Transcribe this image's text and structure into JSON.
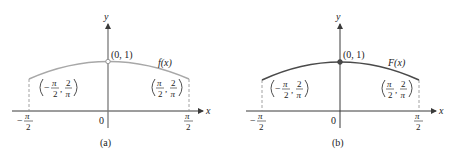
{
  "colors": {
    "axis": "#3a3a3a",
    "curve_a": "#a8a8a8",
    "curve_b": "#4a4a4a",
    "dashed": "#8a8a8a",
    "text": "#222222"
  },
  "panels": [
    {
      "id": "a",
      "caption": "(a)",
      "function_label": "f(x)",
      "point_label": "(0, 1)",
      "point_style": "open",
      "axis_x_label": "x",
      "axis_y_label": "y",
      "origin_label": "0",
      "left_tick": {
        "sign": "−",
        "num": "π",
        "den": "2"
      },
      "right_tick": {
        "num": "π",
        "den": "2"
      },
      "left_point": {
        "sign": "−",
        "x_num": "π",
        "x_den": "2",
        "y_num": "2",
        "y_den": "π"
      },
      "right_point": {
        "x_num": "π",
        "x_den": "2",
        "y_num": "2",
        "y_den": "π"
      }
    },
    {
      "id": "b",
      "caption": "(b)",
      "function_label": "F(x)",
      "point_label": "(0, 1)",
      "point_style": "filled",
      "axis_x_label": "x",
      "axis_y_label": "y",
      "origin_label": "0",
      "left_tick": {
        "sign": "−",
        "num": "π",
        "den": "2"
      },
      "right_tick": {
        "num": "π",
        "den": "2"
      },
      "left_point": {
        "sign": "−",
        "x_num": "π",
        "x_den": "2",
        "y_num": "2",
        "y_den": "π"
      },
      "right_point": {
        "x_num": "π",
        "x_den": "2",
        "y_num": "2",
        "y_den": "π"
      }
    }
  ]
}
